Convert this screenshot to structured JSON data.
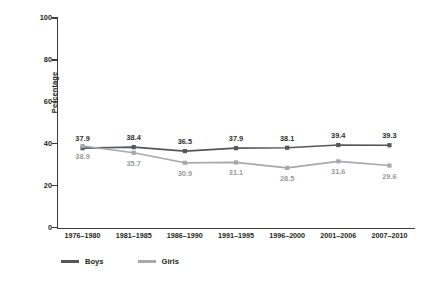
{
  "chart_data": {
    "type": "line",
    "title": "",
    "xlabel": "",
    "ylabel": "Percentage",
    "ylim": [
      0,
      100
    ],
    "yticks": [
      0,
      20,
      40,
      60,
      80,
      100
    ],
    "grid": false,
    "legend_position": "bottom-left",
    "categories": [
      "1976–1980",
      "1981–1985",
      "1986–1990",
      "1991–1995",
      "1996–2000",
      "2001–2006",
      "2007–2010"
    ],
    "series": [
      {
        "name": "Boys",
        "color": "#555759",
        "label_color": "#2f2f2f",
        "label_position": "above",
        "values": [
          37.9,
          38.4,
          36.5,
          37.9,
          38.1,
          39.4,
          39.3
        ],
        "value_labels": [
          "37.9",
          "38.4",
          "36.5",
          "37.9",
          "38.1",
          "39.4",
          "39.3"
        ]
      },
      {
        "name": "Girls",
        "color": "#a6a8ab",
        "label_color": "#9b9b9b",
        "label_position": "below",
        "values": [
          38.9,
          35.7,
          30.9,
          31.1,
          28.5,
          31.6,
          29.6
        ],
        "value_labels": [
          "38.9",
          "35.7",
          "30.9",
          "31.1",
          "28.5",
          "31.6",
          "29.6"
        ]
      }
    ]
  },
  "legend": {
    "items": [
      {
        "label": "Boys",
        "color": "#555759"
      },
      {
        "label": "Girls",
        "color": "#a6a8ab"
      }
    ]
  },
  "axis": {
    "y_title": "Percentage",
    "y_tick_labels": [
      "100",
      "80",
      "60",
      "40",
      "20",
      "0"
    ]
  }
}
